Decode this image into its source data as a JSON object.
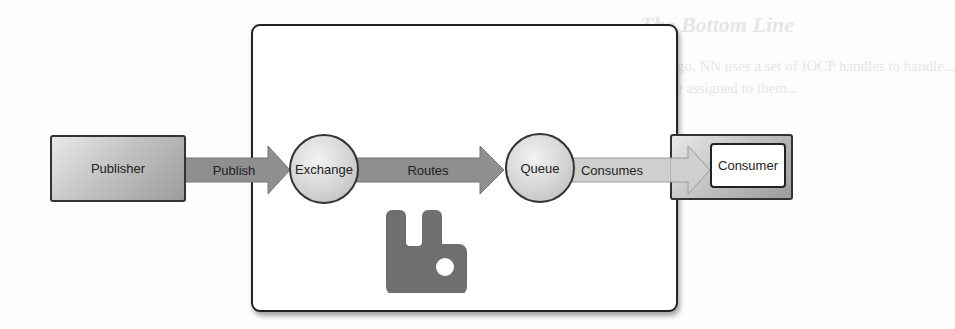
{
  "diagram": {
    "nodes": {
      "publisher": "Publisher",
      "exchange": "Exchange",
      "queue": "Queue",
      "consumer": "Consumer"
    },
    "edges": {
      "publish": "Publish",
      "routes": "Routes",
      "consumes": "Consumes"
    },
    "container": {
      "icon": "rabbitmq-logo-icon"
    },
    "colors": {
      "arrow_dark": "#8f8f8f",
      "arrow_light": "#c9c9c9",
      "logo": "#6f6f6f",
      "border": "#222222"
    }
  }
}
